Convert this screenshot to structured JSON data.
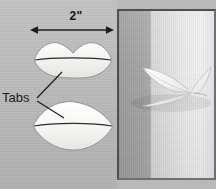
{
  "figure": {
    "type": "craft-instruction-diagram",
    "panels": [
      "pattern-diagram",
      "finished-photo"
    ]
  },
  "diagram": {
    "dimension": {
      "label": "2\"",
      "icon": "double-headed-arrow-icon",
      "measures": "width-of-lip-shape"
    },
    "callout": {
      "label": "Tabs",
      "leader_count": 2,
      "points_to": [
        "upper-shape-tab",
        "lower-shape-tab"
      ]
    },
    "shapes": [
      {
        "name": "upper-lip-shape",
        "description": "lip shaped paper cutout with center fold line",
        "fill": "#f4f4f2",
        "outline": "#8f8f8f",
        "fold_line": "#2b2b2b"
      },
      {
        "name": "lower-leaf-shape",
        "description": "pointed oval paper cutout with center fold line",
        "fill": "#fbfbf9",
        "outline": "#8f8f8f",
        "fold_line": "#2b2b2b"
      }
    ],
    "background_color": "#bcbcbc"
  },
  "photo": {
    "name": "finished-paper-moth-photo",
    "subject": "folded white paper moth with spread wings",
    "border_color": "#4d4f52",
    "background_description": "gray wall with vertical light band",
    "paper_color": "#f7f7f5"
  }
}
